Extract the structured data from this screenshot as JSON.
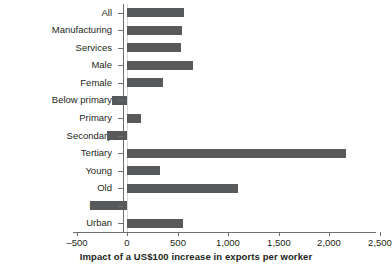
{
  "chart_data": {
    "type": "bar",
    "orientation": "horizontal",
    "title": "",
    "xlabel": "Impact of a US$100 increase in exports per worker",
    "ylabel": "",
    "categories": [
      "All",
      "Manufacturing",
      "Services",
      "Male",
      "Female",
      "Below primary",
      "Primary",
      "Secondary",
      "Tertiary",
      "Young",
      "Old",
      "Rural",
      "Urban"
    ],
    "values": [
      560,
      540,
      530,
      650,
      360,
      -150,
      140,
      -200,
      2170,
      330,
      1100,
      -370,
      550
    ],
    "xlim": [
      -500,
      2500
    ],
    "xticks": [
      -500,
      0,
      500,
      1000,
      1500,
      2000,
      2500
    ],
    "xtick_labels": [
      "–500",
      "0",
      "500",
      "1,000",
      "1,500",
      "2,000",
      "2,500"
    ],
    "grid": false,
    "legend": null,
    "bar_color": "#58595b",
    "axis_color": "#6d6e71",
    "text_color": "#231f20"
  }
}
